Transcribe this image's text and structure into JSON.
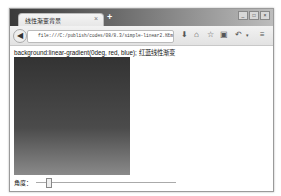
{
  "browser": {
    "tab_title": "线性渐变背景",
    "tab_close": "×",
    "new_tab": "+",
    "url": "file:///C:/publish/codes/08/8.3/simple-linear2.htm",
    "reload": "C",
    "window_controls": [
      "_",
      "□",
      "×"
    ],
    "toolbar_icons": [
      "download-icon",
      "home-icon",
      "bookmark-star-icon",
      "screenshot-icon",
      "undo-icon",
      "dropdown-icon",
      "menu-icon"
    ]
  },
  "page": {
    "code_text": "background:linear-gradient(0deg, red, blue);  红蓝线性渐变",
    "gradient": {
      "angle_deg": 0,
      "colors": [
        "red",
        "blue"
      ]
    },
    "angle_label": "角度：",
    "slider_value": 0
  }
}
